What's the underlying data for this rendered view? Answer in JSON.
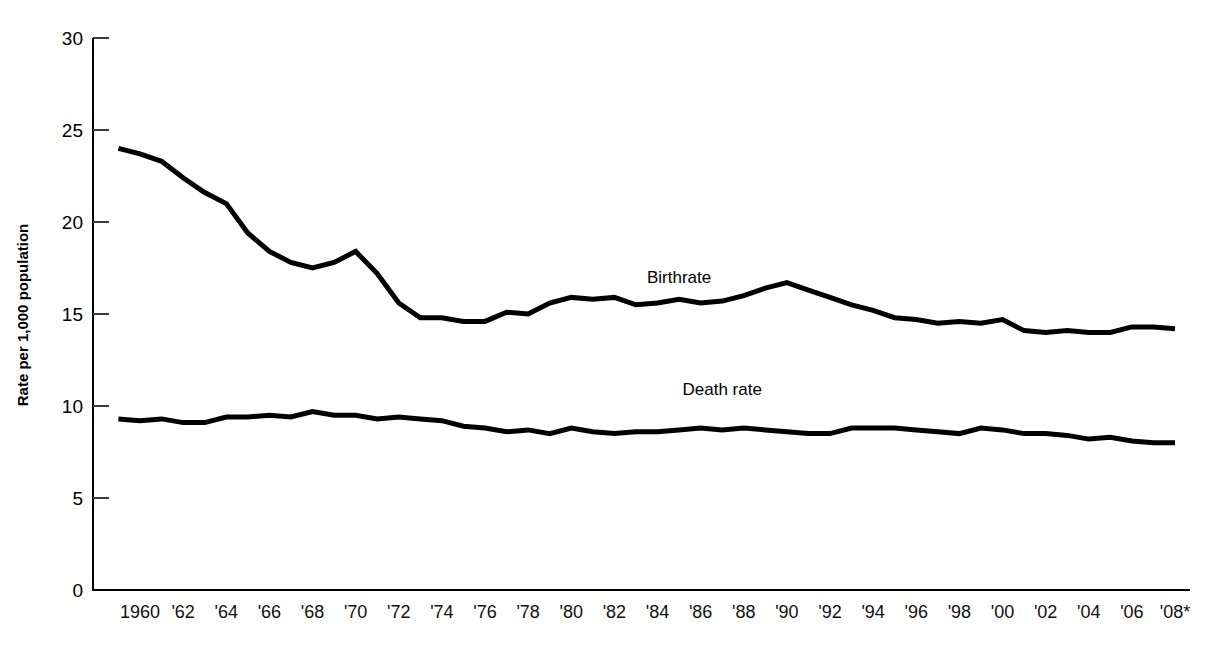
{
  "chart_data": {
    "type": "line",
    "title": "",
    "xlabel": "",
    "ylabel": "Rate per 1,000 population",
    "ylim": [
      0,
      30
    ],
    "xlim": [
      1959,
      2008
    ],
    "yticks": [
      0,
      5,
      10,
      15,
      20,
      25,
      30
    ],
    "ytick_labels": [
      "0",
      "5",
      "10",
      "15",
      "20",
      "25",
      "30"
    ],
    "grid": false,
    "legend_position": "inline-annotation",
    "xtick_labels": [
      "1960",
      "'62",
      "'64",
      "'66",
      "'68",
      "'70",
      "'72",
      "'74",
      "'76",
      "'78",
      "'80",
      "'82",
      "'84",
      "'86",
      "'88",
      "'90",
      "'92",
      "'94",
      "'96",
      "'98",
      "'00",
      "'02",
      "'04",
      "'06",
      "'08*"
    ],
    "xtick_values": [
      1960,
      1962,
      1964,
      1966,
      1968,
      1970,
      1972,
      1974,
      1976,
      1978,
      1980,
      1982,
      1984,
      1986,
      1988,
      1990,
      1992,
      1994,
      1996,
      1998,
      2000,
      2002,
      2004,
      2006,
      2008
    ],
    "x": [
      1959,
      1960,
      1961,
      1962,
      1963,
      1964,
      1965,
      1966,
      1967,
      1968,
      1969,
      1970,
      1971,
      1972,
      1973,
      1974,
      1975,
      1976,
      1977,
      1978,
      1979,
      1980,
      1981,
      1982,
      1983,
      1984,
      1985,
      1986,
      1987,
      1988,
      1989,
      1990,
      1991,
      1992,
      1993,
      1994,
      1995,
      1996,
      1997,
      1998,
      1999,
      2000,
      2001,
      2002,
      2003,
      2004,
      2005,
      2006,
      2007,
      2008
    ],
    "series": [
      {
        "name": "Birthrate",
        "color": "#000000",
        "label_x": 1985,
        "label_y": 16.7,
        "values": [
          24.0,
          23.7,
          23.3,
          22.4,
          21.6,
          21.0,
          19.4,
          18.4,
          17.8,
          17.5,
          17.8,
          18.4,
          17.2,
          15.6,
          14.8,
          14.8,
          14.6,
          14.6,
          15.1,
          15.0,
          15.6,
          15.9,
          15.8,
          15.9,
          15.5,
          15.6,
          15.8,
          15.6,
          15.7,
          16.0,
          16.4,
          16.7,
          16.3,
          15.9,
          15.5,
          15.2,
          14.8,
          14.7,
          14.5,
          14.6,
          14.5,
          14.7,
          14.1,
          14.0,
          14.1,
          14.0,
          14.0,
          14.3,
          14.3,
          14.2
        ]
      },
      {
        "name": "Death rate",
        "color": "#000000",
        "label_x": 1987,
        "label_y": 10.6,
        "values": [
          9.3,
          9.2,
          9.3,
          9.1,
          9.1,
          9.4,
          9.4,
          9.5,
          9.4,
          9.7,
          9.5,
          9.5,
          9.3,
          9.4,
          9.3,
          9.2,
          8.9,
          8.8,
          8.6,
          8.7,
          8.5,
          8.8,
          8.6,
          8.5,
          8.6,
          8.6,
          8.7,
          8.8,
          8.7,
          8.8,
          8.7,
          8.6,
          8.5,
          8.5,
          8.8,
          8.8,
          8.8,
          8.7,
          8.6,
          8.5,
          8.8,
          8.7,
          8.5,
          8.5,
          8.4,
          8.2,
          8.3,
          8.1,
          8.0,
          8.0
        ]
      }
    ],
    "line_points": {
      "birthrate_px": "115,148 138,152 158,161 180,177 202,188 224,204 246,238 268,259 290,275 311,280 333,268 355,252 377,282 399,314 421,320 443,323 464,328 486,332 508,320 530,322 552,312 574,302 596,305 618,303 640,307 661,302 683,291 705,306 727,301 749,298 771,290 793,279 815,288 837,295 859,303 881,310 902,318 924,316 946,312 968,309 990,313 1012,307 1034,320 1055,322 1077,318 1099,320 1121,320 1143,313 1165,313 1175,315",
      "death_rate_px": "115,420 138,421 158,420 180,423 202,423 224,418 246,418 268,416 290,418 311,412 333,416 355,416 377,420 399,418 421,420 443,422 464,427 486,429 508,433 530,430 552,436 574,428 596,434 618,436 640,433 661,433 683,431 705,428 727,431 749,428 771,431 793,433 815,436 837,436 859,428 881,428 902,428 924,431 946,433 968,436 990,428 1012,431 1034,436 1055,436 1077,438 1099,442 1121,440 1143,444 1165,446 1175,446"
    }
  },
  "axis": {
    "y_label": "Rate per 1,000 population"
  }
}
